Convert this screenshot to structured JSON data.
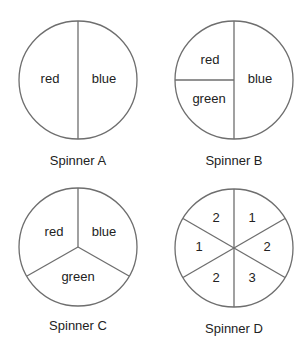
{
  "spinners": [
    {
      "name": "Spinner A",
      "sections": [
        {
          "label": "red",
          "fraction": 0.5
        },
        {
          "label": "blue",
          "fraction": 0.5
        }
      ]
    },
    {
      "name": "Spinner B",
      "sections": [
        {
          "label": "red",
          "fraction": 0.25
        },
        {
          "label": "green",
          "fraction": 0.25
        },
        {
          "label": "blue",
          "fraction": 0.5
        }
      ]
    },
    {
      "name": "Spinner C",
      "sections": [
        {
          "label": "red",
          "fraction": 0.3333
        },
        {
          "label": "blue",
          "fraction": 0.3333
        },
        {
          "label": "green",
          "fraction": 0.3333
        }
      ]
    },
    {
      "name": "Spinner D",
      "sections": [
        {
          "label": "2",
          "fraction": 0.1667
        },
        {
          "label": "1",
          "fraction": 0.1667
        },
        {
          "label": "2",
          "fraction": 0.1667
        },
        {
          "label": "3",
          "fraction": 0.1667
        },
        {
          "label": "2",
          "fraction": 0.1667
        },
        {
          "label": "1",
          "fraction": 0.1667
        }
      ]
    }
  ],
  "colors": {
    "outline": "#6e6e6e",
    "text": "#222222",
    "background": "#ffffff"
  }
}
